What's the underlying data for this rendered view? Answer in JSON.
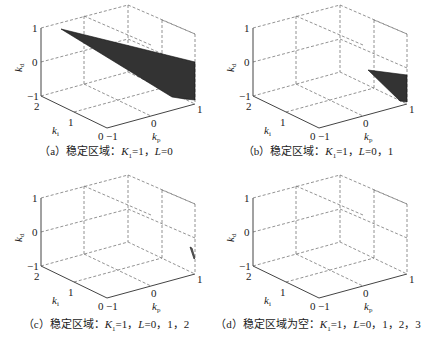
{
  "chart_data": [
    {
      "type": "3d-surface-region",
      "panel": "a",
      "title": "（a）稳定区域：K1=1，L=0",
      "xlabel": "kp",
      "ylabel": "ki",
      "zlabel": "kd",
      "xlim": [
        -1,
        1
      ],
      "ylim": [
        0,
        2
      ],
      "zlim": [
        -1,
        1
      ],
      "xticks": [
        "-1",
        "0",
        "1"
      ],
      "yticks": [
        "0",
        "1",
        "2"
      ],
      "zticks": [
        "-1",
        "0",
        "1"
      ],
      "grid": true,
      "region": "large dark wedge from (kp=-1, ki=2, kd=1) widening toward kp=1, ki=0, spanning kd≈0..-1",
      "fill_color": "#333333"
    },
    {
      "type": "3d-surface-region",
      "panel": "b",
      "title": "（b）稳定区域：K1=1，L=0，1",
      "xlabel": "kp",
      "ylabel": "ki",
      "zlabel": "kd",
      "xlim": [
        -1,
        1
      ],
      "ylim": [
        0,
        2
      ],
      "zlim": [
        -1,
        1
      ],
      "xticks": [
        "-1",
        "0",
        "1"
      ],
      "yticks": [
        "0",
        "1",
        "2"
      ],
      "zticks": [
        "-1",
        "0",
        "1"
      ],
      "grid": true,
      "region": "small dark wedge near kp≈0.5..1, ki≈0, kd≈-0.3..-1",
      "fill_color": "#333333"
    },
    {
      "type": "3d-surface-region",
      "panel": "c",
      "title": "（c）稳定区域：K1=1，L=0，1，2",
      "xlabel": "kp",
      "ylabel": "ki",
      "zlabel": "kd",
      "xlim": [
        -1,
        1
      ],
      "ylim": [
        0,
        2
      ],
      "zlim": [
        -1,
        1
      ],
      "xticks": [
        "-1",
        "0",
        "1"
      ],
      "yticks": [
        "0",
        "1",
        "2"
      ],
      "zticks": [
        "-1",
        "0",
        "1"
      ],
      "grid": true,
      "region": "tiny sliver near kp=1, ki=0, kd≈-0.3",
      "fill_color": "#555555"
    },
    {
      "type": "3d-surface-region",
      "panel": "d",
      "title": "（d）稳定区域为空：K1=1，L=0，1，2，3",
      "xlabel": "kp",
      "ylabel": "ki",
      "zlabel": "kd",
      "xlim": [
        -1,
        1
      ],
      "ylim": [
        0,
        2
      ],
      "zlim": [
        -1,
        1
      ],
      "xticks": [
        "-1",
        "0",
        "1"
      ],
      "yticks": [
        "0",
        "1",
        "2"
      ],
      "zticks": [
        "-1",
        "0",
        "1"
      ],
      "grid": true,
      "region": "empty"
    }
  ],
  "panels": [
    {
      "tag": "（a）",
      "text": "稳定区域：",
      "kvar": "K",
      "ksub": "1",
      "rest": "=1，",
      "lvar": "L",
      "lrest": "=0"
    },
    {
      "tag": "（b）",
      "text": "稳定区域：",
      "kvar": "K",
      "ksub": "1",
      "rest": "=1，",
      "lvar": "L",
      "lrest": "=0，1"
    },
    {
      "tag": "（c）",
      "text": "稳定区域：",
      "kvar": "K",
      "ksub": "1",
      "rest": "=1，",
      "lvar": "L",
      "lrest": "=0，1，2"
    },
    {
      "tag": "（d）",
      "text": "稳定区域为空：",
      "kvar": "K",
      "ksub": "1",
      "rest": "=1，",
      "lvar": "L",
      "lrest": "=0，1，2，3"
    }
  ],
  "axes": {
    "z": {
      "label": "k",
      "sub": "d",
      "ticks": [
        "1",
        "0",
        "−1"
      ]
    },
    "y": {
      "label": "k",
      "sub": "i",
      "ticks": [
        "2",
        "1",
        "0"
      ]
    },
    "x": {
      "label": "k",
      "sub": "p",
      "ticks": [
        "−1",
        "0",
        "1"
      ]
    }
  }
}
